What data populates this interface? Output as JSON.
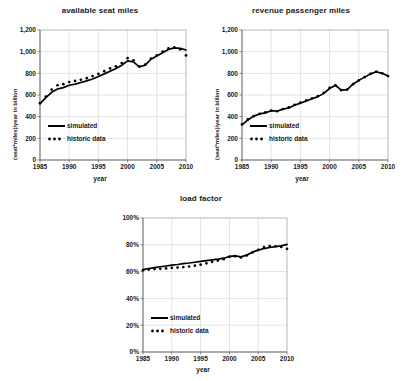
{
  "figure": {
    "panels": [
      "available seat miles",
      "revenue passenger miles",
      "load factor"
    ]
  },
  "charts": {
    "asm": {
      "title": "available seat miles",
      "xlabel": "year",
      "ylabel": "(seat*miles)/year  in billion",
      "yticks": [
        "0",
        "200",
        "400",
        "600",
        "800",
        "1,000",
        "1,200"
      ],
      "xticks": [
        "1985",
        "1990",
        "1995",
        "2000",
        "2005",
        "2010"
      ],
      "legend": {
        "simulated": "simulated",
        "historic": "historic data"
      }
    },
    "rpm": {
      "title": "revenue passenger miles",
      "xlabel": "year",
      "ylabel": "(seat*miles)/year  in billion",
      "yticks": [
        "0",
        "200",
        "400",
        "600",
        "800",
        "1,000",
        "1,200"
      ],
      "xticks": [
        "1985",
        "1990",
        "1995",
        "2000",
        "2005",
        "2010"
      ],
      "legend": {
        "simulated": "simulated",
        "historic": "historic data"
      }
    },
    "lf": {
      "title": "load factor",
      "xlabel": "year",
      "ylabel": "",
      "yticks": [
        "0%",
        "20%",
        "40%",
        "60%",
        "80%",
        "100%"
      ],
      "xticks": [
        "1985",
        "1990",
        "1995",
        "2000",
        "2005",
        "2010"
      ],
      "legend": {
        "simulated": "simulated",
        "historic": "historic data"
      }
    }
  },
  "chart_data": [
    {
      "id": "asm",
      "type": "line",
      "title": "available seat miles",
      "xlabel": "year",
      "ylabel": "(seat*miles)/year  in billion",
      "xlim": [
        1985,
        2010
      ],
      "ylim": [
        0,
        1200
      ],
      "grid": true,
      "legend_position": "inside-lower-left",
      "x": [
        1985,
        1986,
        1987,
        1988,
        1989,
        1990,
        1991,
        1992,
        1993,
        1994,
        1995,
        1996,
        1997,
        1998,
        1999,
        2000,
        2001,
        2002,
        2003,
        2004,
        2005,
        2006,
        2007,
        2008,
        2009,
        2010
      ],
      "series": [
        {
          "name": "simulated",
          "style": "solid-line",
          "values": [
            520,
            575,
            625,
            655,
            668,
            690,
            700,
            715,
            730,
            748,
            770,
            795,
            820,
            845,
            875,
            915,
            905,
            860,
            875,
            930,
            960,
            990,
            1020,
            1035,
            1030,
            1015
          ]
        },
        {
          "name": "historic data",
          "style": "dotted-markers",
          "values": [
            525,
            585,
            650,
            690,
            700,
            720,
            730,
            740,
            755,
            775,
            795,
            820,
            845,
            865,
            895,
            940,
            920,
            865,
            880,
            935,
            965,
            1000,
            1030,
            1040,
            1020,
            965
          ]
        }
      ]
    },
    {
      "id": "rpm",
      "type": "line",
      "title": "revenue passenger miles",
      "xlabel": "year",
      "ylabel": "(seat*miles)/year  in billion",
      "xlim": [
        1985,
        2010
      ],
      "ylim": [
        0,
        1200
      ],
      "grid": true,
      "legend_position": "inside-lower-left",
      "x": [
        1985,
        1986,
        1987,
        1988,
        1989,
        1990,
        1991,
        1992,
        1993,
        1994,
        1995,
        1996,
        1997,
        1998,
        1999,
        2000,
        2001,
        2002,
        2003,
        2004,
        2005,
        2006,
        2007,
        2008,
        2009,
        2010
      ],
      "series": [
        {
          "name": "simulated",
          "style": "solid-line",
          "values": [
            325,
            370,
            405,
            425,
            435,
            455,
            450,
            470,
            480,
            505,
            525,
            545,
            565,
            585,
            615,
            660,
            690,
            645,
            650,
            700,
            735,
            765,
            795,
            815,
            800,
            775
          ]
        },
        {
          "name": "historic data",
          "style": "dotted-markers",
          "values": [
            330,
            375,
            405,
            425,
            440,
            455,
            450,
            470,
            485,
            510,
            530,
            550,
            570,
            590,
            620,
            665,
            690,
            645,
            650,
            700,
            735,
            765,
            795,
            815,
            800,
            775
          ]
        }
      ]
    },
    {
      "id": "lf",
      "type": "line",
      "title": "load factor",
      "xlabel": "year",
      "ylabel": "",
      "xlim": [
        1985,
        2010
      ],
      "ylim": [
        0,
        100
      ],
      "unit": "%",
      "grid": true,
      "legend_position": "inside-lower-left",
      "x": [
        1985,
        1986,
        1987,
        1988,
        1989,
        1990,
        1991,
        1992,
        1993,
        1994,
        1995,
        1996,
        1997,
        1998,
        1999,
        2000,
        2001,
        2002,
        2003,
        2004,
        2005,
        2006,
        2007,
        2008,
        2009,
        2010
      ],
      "series": [
        {
          "name": "simulated",
          "style": "solid-line",
          "values": [
            61.5,
            62.3,
            63.0,
            63.6,
            64.2,
            64.8,
            65.3,
            65.9,
            66.4,
            67.0,
            67.6,
            68.2,
            68.8,
            69.3,
            70.0,
            71.3,
            71.8,
            71.0,
            72.3,
            74.5,
            76.0,
            77.2,
            78.0,
            78.6,
            79.2,
            80.3
          ]
        },
        {
          "name": "historic data",
          "style": "dotted-markers",
          "values": [
            61.0,
            61.5,
            61.9,
            62.1,
            62.4,
            62.8,
            63.0,
            63.4,
            63.8,
            64.4,
            65.2,
            66.2,
            67.3,
            68.2,
            69.3,
            71.0,
            71.5,
            70.6,
            72.0,
            74.3,
            76.2,
            78.3,
            79.0,
            78.9,
            78.4,
            77.0
          ]
        }
      ]
    }
  ]
}
